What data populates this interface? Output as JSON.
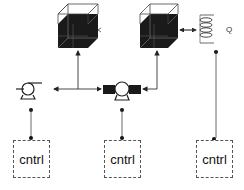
{
  "diagram": {
    "type": "process-control-schematic",
    "components": {
      "tank_left": {
        "label": "tank"
      },
      "tank_right": {
        "label": "tank"
      },
      "heater_coil": {
        "label": "Q"
      },
      "pump_left": {
        "label": "pump"
      },
      "pump_middle": {
        "label": "pump-valve"
      }
    },
    "controllers": [
      {
        "label": "cntrl"
      },
      {
        "label": "cntrl"
      },
      {
        "label": "cntrl"
      }
    ],
    "colors": {
      "line": "#333333",
      "fill_dark": "#1a1a1a",
      "box_border": "#555555"
    }
  }
}
